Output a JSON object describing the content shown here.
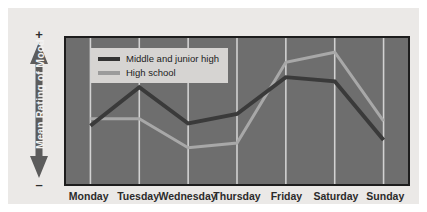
{
  "figure": {
    "y_axis": {
      "label": "Mean Rating of Mood",
      "positive_sign": "+",
      "negative_sign": "–"
    },
    "legend": {
      "series": [
        {
          "label": "Middle and junior high",
          "swatch": "dark"
        },
        {
          "label": "High school",
          "swatch": "light"
        }
      ]
    },
    "colors": {
      "plot_background": "#6e6e6e",
      "panel_background": "#ebe9e7",
      "plot_border": "#1d1d1d",
      "gridline": "#d2d2d2",
      "series_dark": "#3a3a3a",
      "series_light": "#a8a8a8",
      "legend_background": "#d6d4d2",
      "axis_arrow": "#5c5c5c",
      "axis_label_text": "#f2f2f2",
      "tick_label_text": "#2b2b2b"
    }
  },
  "chart_data": {
    "type": "line",
    "title": "",
    "xlabel": "",
    "ylabel": "Mean Rating of Mood",
    "categories": [
      "Monday",
      "Tuesday",
      "Wednesday",
      "Thursday",
      "Friday",
      "Saturday",
      "Sunday"
    ],
    "grid": true,
    "grid_axis": "x",
    "legend_position": "top-left",
    "ylim": [
      -1,
      1
    ],
    "y_axis_type": "qualitative",
    "y_axis_endpoints": [
      "–",
      "+"
    ],
    "series": [
      {
        "name": "Middle and junior high",
        "color": "#3a3a3a",
        "values": [
          -0.25,
          0.4,
          -0.21,
          -0.05,
          0.57,
          0.5,
          -0.49
        ]
      },
      {
        "name": "High school",
        "color": "#a8a8a8",
        "values": [
          -0.13,
          -0.13,
          -0.62,
          -0.54,
          0.82,
          0.99,
          -0.17
        ]
      }
    ]
  }
}
